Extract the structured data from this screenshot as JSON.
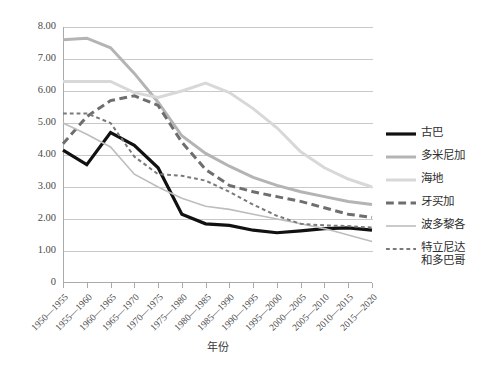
{
  "chart_data": {
    "type": "line",
    "title": "",
    "xlabel": "年份",
    "ylabel": "",
    "ylim": [
      0,
      8
    ],
    "ytick_labels": [
      "8.00",
      "7.00",
      "6.00",
      "5.00",
      "4.00",
      "3.00",
      "2.00",
      "1.00",
      "0"
    ],
    "ytick_values": [
      8,
      7,
      6,
      5,
      4,
      3,
      2,
      1,
      0
    ],
    "grid": true,
    "legend_position": "right",
    "categories": [
      "1950—1955",
      "1955—1960",
      "1960—1965",
      "1965—1970",
      "1970—1975",
      "1975—1980",
      "1980—1985",
      "1985—1990",
      "1990—1995",
      "1995—2000",
      "2000—2005",
      "2005—2010",
      "2010—2015",
      "2015—2020"
    ],
    "series": [
      {
        "name": "古巴",
        "color": "#111111",
        "style": "solid",
        "width": 3.2,
        "values": [
          4.15,
          3.7,
          4.7,
          4.3,
          3.6,
          2.15,
          1.85,
          1.8,
          1.65,
          1.57,
          1.63,
          1.7,
          1.72,
          1.65
        ]
      },
      {
        "name": "多米尼加",
        "color": "#b4b4b4",
        "style": "solid",
        "width": 3.0,
        "values": [
          7.6,
          7.65,
          7.35,
          6.55,
          5.65,
          4.6,
          4.05,
          3.65,
          3.3,
          3.05,
          2.85,
          2.7,
          2.55,
          2.45
        ]
      },
      {
        "name": "海地",
        "color": "#d8d8d8",
        "style": "solid",
        "width": 3.0,
        "values": [
          6.3,
          6.3,
          6.3,
          5.95,
          5.8,
          6.0,
          6.25,
          5.95,
          5.45,
          4.85,
          4.1,
          3.6,
          3.25,
          3.0
        ]
      },
      {
        "name": "牙买加",
        "color": "#6e6e6e",
        "style": "dashed",
        "width": 3.0,
        "values": [
          4.35,
          5.2,
          5.7,
          5.85,
          5.55,
          4.4,
          3.55,
          3.05,
          2.85,
          2.7,
          2.55,
          2.35,
          2.15,
          2.05
        ]
      },
      {
        "name": "波多黎各",
        "color": "#bdbdbd",
        "style": "solid",
        "width": 1.6,
        "values": [
          5.0,
          4.65,
          4.25,
          3.4,
          3.0,
          2.65,
          2.4,
          2.3,
          2.15,
          2.0,
          1.85,
          1.7,
          1.5,
          1.3
        ]
      },
      {
        "name": "特立尼达\n和多巴哥",
        "color": "#7a7a7a",
        "style": "dotted",
        "width": 2.0,
        "values": [
          5.3,
          5.3,
          5.0,
          3.95,
          3.4,
          3.35,
          3.2,
          2.85,
          2.45,
          2.1,
          1.85,
          1.8,
          1.78,
          1.73
        ]
      }
    ]
  },
  "legend": {
    "items": [
      {
        "label": "古巴"
      },
      {
        "label": "多米尼加"
      },
      {
        "label": "海地"
      },
      {
        "label": "牙买加"
      },
      {
        "label": "波多黎各"
      },
      {
        "label": "特立尼达\n和多巴哥"
      }
    ]
  }
}
